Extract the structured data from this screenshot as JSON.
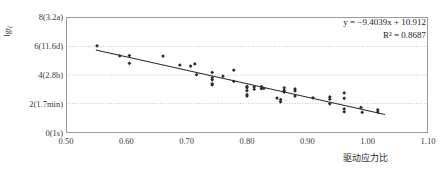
{
  "chart_data": {
    "type": "scatter",
    "title": "",
    "subtitle": "",
    "xlabel": "驱动应力比",
    "ylabel": "lg t_f",
    "ylabel_parts": {
      "prefix": "lg",
      "variable": "t",
      "subscript": "f"
    },
    "xlim": [
      0.5,
      1.1
    ],
    "ylim": [
      0,
      8
    ],
    "grid": true,
    "grid_axis": "y",
    "legend": null,
    "legend_position": "none",
    "xticks": [
      "0.50",
      "0.60",
      "0.70",
      "0.80",
      "0.90",
      "1.00",
      "1.10"
    ],
    "xtick_values": [
      0.5,
      0.6,
      0.7,
      0.8,
      0.9,
      1.0,
      1.1
    ],
    "yticks": [
      "0(1s)",
      "2(1.7min)",
      "4(2.8h)",
      "6(11.6d)",
      "8(3.2a)"
    ],
    "ytick_values": [
      0,
      2,
      4,
      6,
      8
    ],
    "annotations": [
      {
        "name": "regression-equation",
        "text": "y = −9.4039x + 10.912"
      },
      {
        "name": "r-squared",
        "text": "R² = 0.8687"
      }
    ],
    "series": [
      {
        "name": "data-points",
        "type": "scatter",
        "marker": "diamond",
        "color": "#2b2b2b",
        "points": [
          [
            0.55,
            6.05
          ],
          [
            0.588,
            5.34
          ],
          [
            0.604,
            5.36
          ],
          [
            0.604,
            4.82
          ],
          [
            0.66,
            5.33
          ],
          [
            0.688,
            4.7
          ],
          [
            0.706,
            4.63
          ],
          [
            0.713,
            4.78
          ],
          [
            0.716,
            4.02
          ],
          [
            0.742,
            4.18
          ],
          [
            0.742,
            3.8
          ],
          [
            0.742,
            3.66
          ],
          [
            0.742,
            3.38
          ],
          [
            0.742,
            3.3
          ],
          [
            0.76,
            3.92
          ],
          [
            0.778,
            4.34
          ],
          [
            0.778,
            3.56
          ],
          [
            0.8,
            3.2
          ],
          [
            0.8,
            3.1
          ],
          [
            0.8,
            2.9
          ],
          [
            0.8,
            2.62
          ],
          [
            0.8,
            2.52
          ],
          [
            0.812,
            3.16
          ],
          [
            0.812,
            3.0
          ],
          [
            0.824,
            3.18
          ],
          [
            0.824,
            3.04
          ],
          [
            0.828,
            3.06
          ],
          [
            0.85,
            2.38
          ],
          [
            0.856,
            2.28
          ],
          [
            0.856,
            2.12
          ],
          [
            0.862,
            3.1
          ],
          [
            0.862,
            2.92
          ],
          [
            0.862,
            2.8
          ],
          [
            0.88,
            3.02
          ],
          [
            0.88,
            2.88
          ],
          [
            0.88,
            2.52
          ],
          [
            0.91,
            2.4
          ],
          [
            0.938,
            2.46
          ],
          [
            0.938,
            2.3
          ],
          [
            0.938,
            1.98
          ],
          [
            0.962,
            2.74
          ],
          [
            0.962,
            2.36
          ],
          [
            0.962,
            1.62
          ],
          [
            0.962,
            1.42
          ],
          [
            0.99,
            1.72
          ],
          [
            0.992,
            1.38
          ],
          [
            1.018,
            1.56
          ],
          [
            1.018,
            1.4
          ]
        ]
      },
      {
        "name": "regression-line",
        "type": "line",
        "color": "#2b2b2b",
        "slope": -9.4039,
        "intercept": 10.912,
        "r_squared": 0.8687,
        "x_start": 0.548,
        "x_end": 1.03
      }
    ]
  },
  "axes": {
    "y_title_prefix": "lg",
    "y_title_var": "t",
    "y_title_sub": "f",
    "x_title": "驱动应力比"
  },
  "annotation": {
    "equation": "y = −9.4039x + 10.912",
    "rsquared": "R² = 0.8687"
  },
  "colors": {
    "marker": "#2b2b2b",
    "line": "#2b2b2b",
    "grid": "#b8b8b8",
    "frame": "#9a9a9a",
    "text": "#3a3a3a"
  }
}
